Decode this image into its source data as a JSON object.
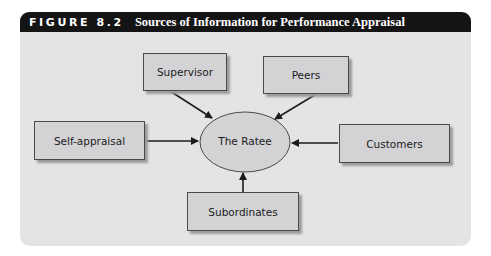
{
  "figure": {
    "number": "FIGURE 8.2",
    "title": "Sources of Information for Performance Appraisal"
  },
  "diagram": {
    "center": {
      "label": "The Ratee"
    },
    "sources": [
      {
        "id": "supervisor",
        "label": "Supervisor",
        "position": "top-left"
      },
      {
        "id": "peers",
        "label": "Peers",
        "position": "top-right"
      },
      {
        "id": "self-appraisal",
        "label": "Self-appraisal",
        "position": "left"
      },
      {
        "id": "customers",
        "label": "Customers",
        "position": "right"
      },
      {
        "id": "subordinates",
        "label": "Subordinates",
        "position": "bottom"
      }
    ],
    "edges": [
      {
        "from": "supervisor",
        "to": "center"
      },
      {
        "from": "peers",
        "to": "center"
      },
      {
        "from": "self-appraisal",
        "to": "center"
      },
      {
        "from": "customers",
        "to": "center"
      },
      {
        "from": "subordinates",
        "to": "center"
      }
    ],
    "colors": {
      "header_bg": "#141414",
      "panel_bg": "#e4e4e2",
      "box_fill": "#d3d3d6",
      "ellipse_fill": "#d3d3d6",
      "stroke": "#2a2a2a"
    }
  }
}
